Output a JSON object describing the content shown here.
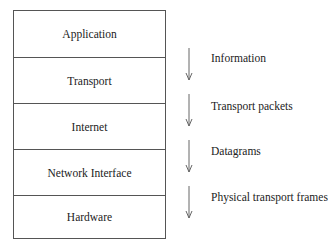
{
  "diagram": {
    "layers": [
      {
        "name": "Application"
      },
      {
        "name": "Transport"
      },
      {
        "name": "Internet"
      },
      {
        "name": "Network Interface"
      },
      {
        "name": "Hardware"
      }
    ],
    "transitions": [
      {
        "label": "Information",
        "from": "Application",
        "to": "Transport",
        "direction": "down"
      },
      {
        "label": "Transport packets",
        "from": "Transport",
        "to": "Internet",
        "direction": "down"
      },
      {
        "label": "Datagrams",
        "from": "Internet",
        "to": "Network Interface",
        "direction": "down"
      },
      {
        "label": "Physical transport frames",
        "from": "Network Interface",
        "to": "Hardware",
        "direction": "down"
      }
    ],
    "colors": {
      "line": "#555555",
      "arrow": "#666666",
      "text": "#222222",
      "background": "#ffffff"
    }
  }
}
